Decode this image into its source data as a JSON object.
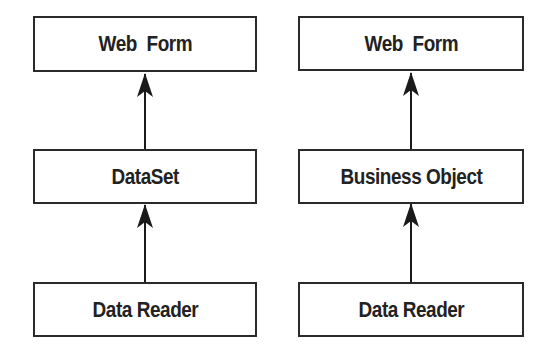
{
  "diagram": {
    "left_stack": {
      "top": "Web  Form",
      "middle": "DataSet",
      "bottom": "Data Reader"
    },
    "right_stack": {
      "top": "Web  Form",
      "middle": "Business Object",
      "bottom": "Data Reader"
    },
    "arrows": [
      {
        "from": "DataSet",
        "to": "Web Form",
        "stack": "left"
      },
      {
        "from": "Data Reader",
        "to": "DataSet",
        "stack": "left"
      },
      {
        "from": "Business Object",
        "to": "Web Form",
        "stack": "right"
      },
      {
        "from": "Data Reader",
        "to": "Business Object",
        "stack": "right"
      }
    ],
    "colors": {
      "stroke": "#2a2a2a",
      "text": "#222222",
      "background": "#ffffff"
    }
  }
}
